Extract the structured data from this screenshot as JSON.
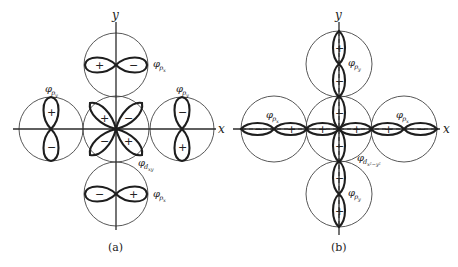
{
  "figure": {
    "panel_a": {
      "caption": "(a)",
      "axes": {
        "x_label": "x",
        "y_label": "y"
      },
      "orbitals": {
        "center": {
          "label": "φ",
          "subscript": "d",
          "subsubscript": "xy",
          "signs": [
            "+",
            "−",
            "−",
            "+"
          ]
        },
        "top": {
          "label": "φ",
          "subscript": "p",
          "subsubscript": "x",
          "signs": [
            "+",
            "−"
          ]
        },
        "bottom": {
          "label": "φ",
          "subscript": "p",
          "subsubscript": "x",
          "signs": [
            "−",
            "+"
          ]
        },
        "left": {
          "label": "φ",
          "subscript": "p",
          "subsubscript": "y",
          "signs": [
            "+",
            "−"
          ]
        },
        "right": {
          "label": "φ",
          "subscript": "p",
          "subsubscript": "y",
          "signs": [
            "−",
            "+"
          ]
        }
      }
    },
    "panel_b": {
      "caption": "(b)",
      "axes": {
        "x_label": "x",
        "y_label": "y"
      },
      "orbitals": {
        "center": {
          "label": "φ",
          "subscript": "d",
          "subsubscript": "x²−y²",
          "signs": [
            "+",
            "+",
            "−",
            "−"
          ]
        },
        "top": {
          "label": "φ",
          "subscript": "p",
          "subsubscript": "y",
          "signs": [
            "+",
            "−"
          ]
        },
        "bottom": {
          "label": "φ",
          "subscript": "p",
          "subsubscript": "y",
          "signs": [
            "−",
            "+"
          ]
        },
        "left": {
          "label": "φ",
          "subscript": "p",
          "subsubscript": "x",
          "signs": [
            "−",
            "+"
          ]
        },
        "right": {
          "label": "φ",
          "subscript": "p",
          "subsubscript": "x",
          "signs": [
            "+",
            "−"
          ]
        }
      }
    }
  }
}
